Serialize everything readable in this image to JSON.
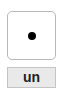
{
  "die": {
    "face_value": 1,
    "pips": 1,
    "icon": "die-face-one-icon"
  },
  "label": {
    "text": "un"
  },
  "colors": {
    "pip": "#000000",
    "die_border": "#b8b8b8",
    "button_bg": "#e9e9e9",
    "button_border": "#c4c4c4"
  }
}
